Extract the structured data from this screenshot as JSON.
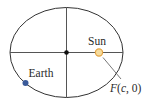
{
  "diagram": {
    "type": "orbit-ellipse",
    "labels": {
      "sun": "Sun",
      "earth": "Earth",
      "focus_prefix": "F",
      "focus_open": "(",
      "focus_var": "c",
      "focus_rest": ", 0)"
    },
    "colors": {
      "ellipse": "#333333",
      "axes": "#555555",
      "center_dot": "#111111",
      "sun_fill": "#f6dc9e",
      "sun_stroke": "#e3a444",
      "earth_fill": "#3a5a9a",
      "leader": "#555555",
      "text": "#2a2a2a"
    }
  }
}
